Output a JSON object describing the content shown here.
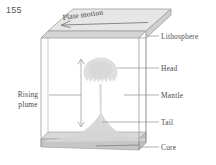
{
  "page": {
    "number": "155"
  },
  "figure": {
    "type": "mantle-plume-diagram",
    "plate_motion_label": "Plate motion",
    "labels": {
      "lithosphere": "Lithosphere",
      "head": "Head",
      "mantle": "Mantle",
      "tail": "Tail",
      "core": "Core",
      "rising_plume_line1": "Rising",
      "rising_plume_line2": "plume"
    },
    "colors": {
      "outline": "#9a9a9a",
      "plate_fill": "#e2e2e2",
      "plate_edge": "#bdbdbd",
      "core_top": "#d7d7d7",
      "core_side": "#c2c2c2",
      "plume_fill": "#e3e3e3",
      "arrow": "#8c8c8c",
      "leader": "#8c8c8c",
      "text": "#4a4a4a"
    }
  }
}
